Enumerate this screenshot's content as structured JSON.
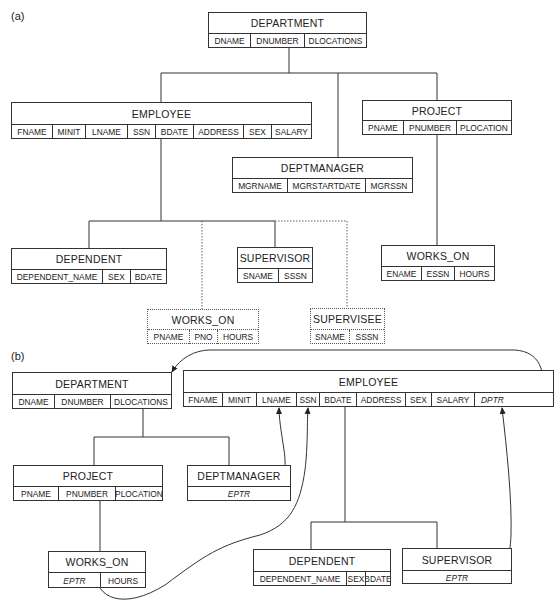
{
  "diagram": {
    "part_a": {
      "label": "(a)",
      "records": {
        "department": {
          "name": "DEPARTMENT",
          "fields": [
            "DNAME",
            "DNUMBER",
            "DLOCATIONS"
          ]
        },
        "employee": {
          "name": "EMPLOYEE",
          "fields": [
            "FNAME",
            "MINIT",
            "LNAME",
            "SSN",
            "BDATE",
            "ADDRESS",
            "SEX",
            "SALARY"
          ]
        },
        "project": {
          "name": "PROJECT",
          "fields": [
            "PNAME",
            "PNUMBER",
            "PLOCATION"
          ]
        },
        "deptmanager": {
          "name": "DEPTMANAGER",
          "fields": [
            "MGRNAME",
            "MGRSTARTDATE",
            "MGRSSN"
          ]
        },
        "dependent": {
          "name": "DEPENDENT",
          "fields": [
            "DEPENDENT_NAME",
            "SEX",
            "BDATE"
          ]
        },
        "supervisor": {
          "name": "SUPERVISOR",
          "fields": [
            "SNAME",
            "SSSN"
          ]
        },
        "works_on_virtual": {
          "name": "WORKS_ON",
          "fields": [
            "PNAME",
            "PNO",
            "HOURS"
          ],
          "style": "dotted"
        },
        "supervisee_virtual": {
          "name": "SUPERVISEE",
          "fields": [
            "SNAME",
            "SSSN"
          ],
          "style": "dotted"
        },
        "works_on_project": {
          "name": "WORKS_ON",
          "fields": [
            "ENAME",
            "ESSN",
            "HOURS"
          ]
        }
      }
    },
    "part_b": {
      "label": "(b)",
      "records": {
        "department": {
          "name": "DEPARTMENT",
          "fields": [
            "DNAME",
            "DNUMBER",
            "DLOCATIONS"
          ]
        },
        "employee": {
          "name": "EMPLOYEE",
          "fields": [
            "FNAME",
            "MINIT",
            "LNAME",
            "SSN",
            "BDATE",
            "ADDRESS",
            "SEX",
            "SALARY",
            "DPTR"
          ]
        },
        "project": {
          "name": "PROJECT",
          "fields": [
            "PNAME",
            "PNUMBER",
            "PLOCATION"
          ]
        },
        "deptmanager": {
          "name": "DEPTMANAGER",
          "fields": [
            "EPTR"
          ]
        },
        "works_on": {
          "name": "WORKS_ON",
          "fields": [
            "EPTR",
            "HOURS"
          ]
        },
        "dependent": {
          "name": "DEPENDENT",
          "fields": [
            "DEPENDENT_NAME",
            "SEX",
            "BDATE"
          ]
        },
        "supervisor": {
          "name": "SUPERVISOR",
          "fields": [
            "EPTR"
          ]
        }
      },
      "pointers": [
        {
          "from": "EMPLOYEE.DPTR",
          "to": "DEPARTMENT"
        },
        {
          "from": "DEPTMANAGER.EPTR",
          "to": "EMPLOYEE.LNAME"
        },
        {
          "from": "WORKS_ON.EPTR",
          "to": "EMPLOYEE.SSN"
        },
        {
          "from": "SUPERVISOR.EPTR",
          "to": "EMPLOYEE.DPTR"
        }
      ]
    }
  }
}
